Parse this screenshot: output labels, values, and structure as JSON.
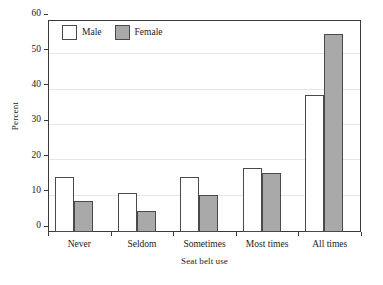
{
  "chart_data": {
    "type": "bar",
    "title": "",
    "xlabel": "Seat belt use",
    "ylabel": "Percent",
    "categories": [
      "Never",
      "Seldom",
      "Sometimes",
      "Most times",
      "All times"
    ],
    "series": [
      {
        "name": "Male",
        "color": "#ffffff",
        "values": [
          15.6,
          11.1,
          15.6,
          18.0,
          38.8
        ]
      },
      {
        "name": "Female",
        "color": "#a9a9a9",
        "values": [
          8.8,
          6.0,
          10.6,
          16.7,
          56.1
        ]
      }
    ],
    "ylim": [
      0,
      60
    ],
    "yticks": [
      0,
      10,
      20,
      30,
      40,
      50,
      60
    ],
    "ytick_labels": [
      "0",
      "10",
      "20",
      "30",
      "40",
      "50",
      "60"
    ],
    "grid": true,
    "grid_axis": "y",
    "legend_position": "top-left",
    "bar_border_color": "#4a4a4a",
    "frame_color": "#3a3a3a",
    "gridline_color": "#e6e6e6"
  },
  "legend": {
    "items": [
      {
        "label": "Male"
      },
      {
        "label": "Female"
      }
    ]
  },
  "axes": {
    "y_title": "Percent",
    "x_title": "Seat belt use"
  }
}
